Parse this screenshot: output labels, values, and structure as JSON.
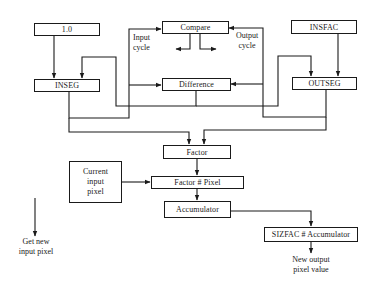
{
  "diagram": {
    "type": "flowchart",
    "nodes": {
      "one": "1.0",
      "inseg": "INSEG",
      "compare": "Compare",
      "difference": "Difference",
      "insfac": "INSFAC",
      "outseg": "OUTSEG",
      "factor": "Factor",
      "current_pixel_line1": "Current",
      "current_pixel_line2": "input",
      "current_pixel_line3": "pixel",
      "factor_pixel": "Factor # Pixel",
      "accumulator": "Accumulator",
      "sizfac_accumulator": "SIZFAC # Accumulator"
    },
    "labels": {
      "input_cycle_line1": "Input",
      "input_cycle_line2": "cycle",
      "output_cycle_line1": "Output",
      "output_cycle_line2": "cycle",
      "get_new_line1": "Get new",
      "get_new_line2": "input pixel",
      "new_output_line1": "New output",
      "new_output_line2": "pixel value"
    },
    "edges": [
      {
        "from": "1.0",
        "to": "INSEG"
      },
      {
        "from": "INSFAC",
        "to": "OUTSEG"
      },
      {
        "from": "INSEG",
        "to": "Compare",
        "label": "Input cycle"
      },
      {
        "from": "INSEG",
        "to": "Difference"
      },
      {
        "from": "OUTSEG",
        "to": "Compare",
        "label": "Output cycle"
      },
      {
        "from": "OUTSEG",
        "to": "Difference"
      },
      {
        "from": "Difference",
        "to": "INSEG"
      },
      {
        "from": "Difference",
        "to": "OUTSEG"
      },
      {
        "from": "INSEG",
        "to": "Factor"
      },
      {
        "from": "OUTSEG",
        "to": "Factor"
      },
      {
        "from": "Factor",
        "to": "Factor # Pixel"
      },
      {
        "from": "Current input pixel",
        "to": "Factor # Pixel"
      },
      {
        "from": "Factor # Pixel",
        "to": "Accumulator"
      },
      {
        "from": "Accumulator",
        "to": "SIZFAC # Accumulator"
      },
      {
        "from": "SIZFAC # Accumulator",
        "to": "New output pixel value"
      },
      {
        "from": "Compare",
        "to": "Input cycle / Output cycle branches"
      }
    ]
  }
}
